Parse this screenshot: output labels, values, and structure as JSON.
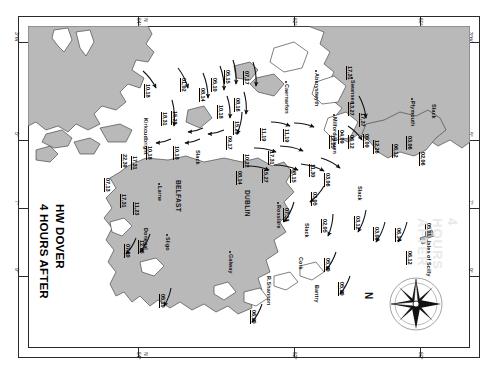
{
  "chart": {
    "title_line1": "4 HOURS AFTER",
    "title_line2": "HW DOVER",
    "compass_label": "N",
    "slack_label": "Slack",
    "watermark": "4 HOURS AFTER"
  },
  "graticule": {
    "top": [
      {
        "label": "54°",
        "sub": "N"
      },
      {
        "label": "52°"
      },
      {
        "label": "50°"
      }
    ],
    "bottom": [
      {
        "label": "54°",
        "sub": "N"
      },
      {
        "label": "52°"
      },
      {
        "label": "50°"
      }
    ],
    "left": [
      {
        "label": "3°W"
      },
      {
        "label": "5°"
      },
      {
        "label": "7°"
      },
      {
        "label": "9°"
      }
    ],
    "right": [
      {
        "label": "3°W"
      },
      {
        "label": "5°"
      },
      {
        "label": "7°"
      },
      {
        "label": "9°"
      }
    ]
  },
  "places": [
    {
      "name": "Kirkcudbright",
      "x": 117,
      "y": 90,
      "dot": false,
      "major": false
    },
    {
      "name": "Larne",
      "x": 131,
      "y": 158,
      "dot": true,
      "major": false
    },
    {
      "name": "BELFAST",
      "x": 150,
      "y": 152,
      "dot": false,
      "major": true
    },
    {
      "name": "Caernarfon",
      "x": 258,
      "y": 56,
      "dot": true,
      "major": false
    },
    {
      "name": "Aberystwyth",
      "x": 288,
      "y": 45,
      "dot": true,
      "major": false
    },
    {
      "name": "Swansea",
      "x": 324,
      "y": 52,
      "dot": true,
      "major": false
    },
    {
      "name": "Milford Haven",
      "x": 306,
      "y": 89,
      "dot": true,
      "major": false
    },
    {
      "name": "Plymouth",
      "x": 384,
      "y": 73,
      "dot": true,
      "major": false
    },
    {
      "name": "DUBLIN",
      "x": 219,
      "y": 162,
      "dot": false,
      "major": true
    },
    {
      "name": "Rosslare",
      "x": 250,
      "y": 177,
      "dot": true,
      "major": false
    },
    {
      "name": "Donegal",
      "x": 117,
      "y": 200,
      "dot": false,
      "major": false
    },
    {
      "name": "Sligo",
      "x": 139,
      "y": 209,
      "dot": true,
      "major": false
    },
    {
      "name": "Galway",
      "x": 202,
      "y": 226,
      "dot": true,
      "major": false
    },
    {
      "name": "R.Shannon",
      "x": 240,
      "y": 248,
      "dot": false,
      "major": false
    },
    {
      "name": "Cork",
      "x": 272,
      "y": 229,
      "dot": false,
      "major": false
    },
    {
      "name": "Bantry",
      "x": 288,
      "y": 257,
      "dot": false,
      "major": false
    },
    {
      "name": "Isles of Scilly",
      "x": 400,
      "y": 213,
      "dot": false,
      "major": false
    }
  ],
  "slack_markers": [
    {
      "x": 173,
      "y": 124
    },
    {
      "x": 335,
      "y": 160
    },
    {
      "x": 282,
      "y": 197
    },
    {
      "x": 409,
      "y": 78
    }
  ],
  "chart_data": {
    "type": "vector-field",
    "units": "tidal stream rate, tenths of a knot (neaps, springs)",
    "rates": [
      {
        "value": "10,18",
        "x": 123,
        "y": 58
      },
      {
        "value": "01,02",
        "x": 159,
        "y": 52
      },
      {
        "value": "08,14",
        "x": 178,
        "y": 62
      },
      {
        "value": "05,10",
        "x": 190,
        "y": 52
      },
      {
        "value": "05,15",
        "x": 203,
        "y": 44
      },
      {
        "value": "07,17",
        "x": 222,
        "y": 45
      },
      {
        "value": "10,18",
        "x": 196,
        "y": 79
      },
      {
        "value": "08,16",
        "x": 213,
        "y": 72
      },
      {
        "value": "18,31",
        "x": 140,
        "y": 86
      },
      {
        "value": "15,23",
        "x": 150,
        "y": 85
      },
      {
        "value": "15,29",
        "x": 212,
        "y": 95
      },
      {
        "value": "09,17",
        "x": 205,
        "y": 110
      },
      {
        "value": "22,39",
        "x": 100,
        "y": 128
      },
      {
        "value": "17,31",
        "x": 110,
        "y": 130
      },
      {
        "value": "10,18",
        "x": 125,
        "y": 120
      },
      {
        "value": "10,18",
        "x": 152,
        "y": 120
      },
      {
        "value": "11,19",
        "x": 239,
        "y": 102
      },
      {
        "value": "11,19",
        "x": 262,
        "y": 103
      },
      {
        "value": "10,22",
        "x": 222,
        "y": 128
      },
      {
        "value": "17,31",
        "x": 247,
        "y": 125
      },
      {
        "value": "08,14",
        "x": 215,
        "y": 145
      },
      {
        "value": "15,27",
        "x": 241,
        "y": 143
      },
      {
        "value": "08,15",
        "x": 269,
        "y": 143
      },
      {
        "value": "11,30",
        "x": 288,
        "y": 138
      },
      {
        "value": "12,25",
        "x": 308,
        "y": 109
      },
      {
        "value": "04,09",
        "x": 317,
        "y": 104
      },
      {
        "value": "06,12",
        "x": 327,
        "y": 109
      },
      {
        "value": "05,09",
        "x": 342,
        "y": 108
      },
      {
        "value": "12,26",
        "x": 352,
        "y": 114
      },
      {
        "value": "13,27",
        "x": 327,
        "y": 76
      },
      {
        "value": "17,37",
        "x": 338,
        "y": 87
      },
      {
        "value": "17,31",
        "x": 325,
        "y": 40
      },
      {
        "value": "06,12",
        "x": 371,
        "y": 118
      },
      {
        "value": "02,06",
        "x": 398,
        "y": 126
      },
      {
        "value": "03,06",
        "x": 385,
        "y": 110
      },
      {
        "value": "03,06",
        "x": 303,
        "y": 147
      },
      {
        "value": "03,05",
        "x": 290,
        "y": 166
      },
      {
        "value": "07,13",
        "x": 262,
        "y": 182
      },
      {
        "value": "02,05",
        "x": 300,
        "y": 193
      },
      {
        "value": "03,12",
        "x": 333,
        "y": 190
      },
      {
        "value": "03,06",
        "x": 352,
        "y": 201
      },
      {
        "value": "06,14",
        "x": 374,
        "y": 202
      },
      {
        "value": "06,12",
        "x": 385,
        "y": 225
      },
      {
        "value": "05,11",
        "x": 404,
        "y": 197
      },
      {
        "value": "07,20",
        "x": 103,
        "y": 218
      },
      {
        "value": "12,26",
        "x": 117,
        "y": 214
      },
      {
        "value": "05,10",
        "x": 138,
        "y": 268
      },
      {
        "value": "06,10",
        "x": 229,
        "y": 284
      },
      {
        "value": "05,10",
        "x": 303,
        "y": 232
      },
      {
        "value": "05,10",
        "x": 317,
        "y": 256
      },
      {
        "value": "07,13",
        "x": 83,
        "y": 152
      },
      {
        "value": "17,31",
        "x": 99,
        "y": 168
      },
      {
        "value": "11,23",
        "x": 112,
        "y": 176
      }
    ],
    "arrows": [
      {
        "x1": 115,
        "y1": 45,
        "x2": 128,
        "y2": 62
      },
      {
        "x1": 150,
        "y1": 42,
        "x2": 160,
        "y2": 62
      },
      {
        "x1": 175,
        "y1": 47,
        "x2": 180,
        "y2": 72
      },
      {
        "x1": 192,
        "y1": 40,
        "x2": 196,
        "y2": 64
      },
      {
        "x1": 205,
        "y1": 34,
        "x2": 208,
        "y2": 58
      },
      {
        "x1": 225,
        "y1": 36,
        "x2": 228,
        "y2": 60
      },
      {
        "x1": 199,
        "y1": 70,
        "x2": 202,
        "y2": 92
      },
      {
        "x1": 216,
        "y1": 66,
        "x2": 218,
        "y2": 88
      },
      {
        "x1": 144,
        "y1": 74,
        "x2": 146,
        "y2": 100
      },
      {
        "x1": 214,
        "y1": 86,
        "x2": 209,
        "y2": 108
      },
      {
        "x1": 175,
        "y1": 102,
        "x2": 160,
        "y2": 106
      },
      {
        "x1": 196,
        "y1": 104,
        "x2": 180,
        "y2": 108
      },
      {
        "x1": 143,
        "y1": 113,
        "x2": 128,
        "y2": 117
      },
      {
        "x1": 172,
        "y1": 113,
        "x2": 157,
        "y2": 117
      },
      {
        "x1": 243,
        "y1": 96,
        "x2": 262,
        "y2": 100
      },
      {
        "x1": 266,
        "y1": 97,
        "x2": 286,
        "y2": 101
      },
      {
        "x1": 226,
        "y1": 122,
        "x2": 248,
        "y2": 126
      },
      {
        "x1": 252,
        "y1": 120,
        "x2": 275,
        "y2": 125
      },
      {
        "x1": 219,
        "y1": 140,
        "x2": 241,
        "y2": 144
      },
      {
        "x1": 246,
        "y1": 139,
        "x2": 270,
        "y2": 144
      },
      {
        "x1": 273,
        "y1": 138,
        "x2": 296,
        "y2": 145
      },
      {
        "x1": 293,
        "y1": 132,
        "x2": 312,
        "y2": 142
      },
      {
        "x1": 320,
        "y1": 100,
        "x2": 334,
        "y2": 114
      },
      {
        "x1": 331,
        "y1": 70,
        "x2": 338,
        "y2": 92
      },
      {
        "x1": 296,
        "y1": 160,
        "x2": 282,
        "y2": 176
      },
      {
        "x1": 266,
        "y1": 176,
        "x2": 256,
        "y2": 196
      },
      {
        "x1": 305,
        "y1": 188,
        "x2": 300,
        "y2": 210
      },
      {
        "x1": 338,
        "y1": 184,
        "x2": 330,
        "y2": 206
      },
      {
        "x1": 357,
        "y1": 196,
        "x2": 348,
        "y2": 216
      },
      {
        "x1": 379,
        "y1": 196,
        "x2": 370,
        "y2": 216
      },
      {
        "x1": 108,
        "y1": 212,
        "x2": 98,
        "y2": 228
      },
      {
        "x1": 122,
        "y1": 208,
        "x2": 112,
        "y2": 226
      },
      {
        "x1": 143,
        "y1": 262,
        "x2": 136,
        "y2": 280
      },
      {
        "x1": 234,
        "y1": 278,
        "x2": 224,
        "y2": 296
      },
      {
        "x1": 308,
        "y1": 226,
        "x2": 298,
        "y2": 244
      },
      {
        "x1": 322,
        "y1": 250,
        "x2": 312,
        "y2": 268
      }
    ]
  }
}
